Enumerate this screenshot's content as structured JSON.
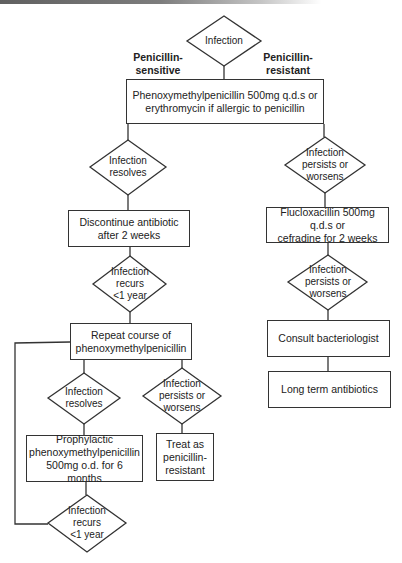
{
  "diagram": {
    "type": "flowchart",
    "branch_labels": {
      "left": "Penicillin-\nsensitive",
      "right": "Penicillin-\nresistant"
    },
    "nodes": {
      "start": {
        "shape": "diamond",
        "text": "Infection"
      },
      "first_line": {
        "shape": "box",
        "text": "Phenoxymethylpenicillin 500mg q.d.s or\nerythromycin if allergic to penicillin"
      },
      "resolves_1": {
        "shape": "diamond",
        "text": "Infection\nresolves"
      },
      "persists_1": {
        "shape": "diamond",
        "text": "Infection\npersists or\nworsens"
      },
      "discontinue": {
        "shape": "box",
        "text": "Discontinue antibiotic\nafter 2 weeks"
      },
      "recurs_1": {
        "shape": "diamond",
        "text": "Infection\nrecurs\n<1 year"
      },
      "fluclox": {
        "shape": "box",
        "text": "Flucloxacillin 500mg q.d.s or\ncefradine for 2 weeks"
      },
      "persists_2": {
        "shape": "diamond",
        "text": "Infection\npersists or\nworsens"
      },
      "consult": {
        "shape": "box",
        "text": "Consult bacteriologist"
      },
      "long_term": {
        "shape": "box",
        "text": "Long term antibiotics"
      },
      "repeat": {
        "shape": "box",
        "text": "Repeat course of\nphenoxymethylpenicillin"
      },
      "resolves_2": {
        "shape": "diamond",
        "text": "Infection\nresolves"
      },
      "persists_3": {
        "shape": "diamond",
        "text": "Infection\npersists or\nworsens"
      },
      "prophylactic": {
        "shape": "box",
        "text": "Prophylactic\nphenoxymethylpenicillin\n500mg o.d. for 6 months"
      },
      "treat_resistant": {
        "shape": "box",
        "text": "Treat as\npenicillin-\nresistant"
      },
      "recurs_2": {
        "shape": "diamond",
        "text": "Infection\nrecurs\n<1 year"
      }
    },
    "edges": [
      [
        "start",
        "first_line"
      ],
      [
        "first_line",
        "resolves_1"
      ],
      [
        "first_line",
        "persists_1"
      ],
      [
        "resolves_1",
        "discontinue"
      ],
      [
        "discontinue",
        "recurs_1"
      ],
      [
        "recurs_1",
        "repeat"
      ],
      [
        "persists_1",
        "fluclox"
      ],
      [
        "fluclox",
        "persists_2"
      ],
      [
        "persists_2",
        "consult"
      ],
      [
        "consult",
        "long_term"
      ],
      [
        "repeat",
        "resolves_2"
      ],
      [
        "repeat",
        "persists_3"
      ],
      [
        "resolves_2",
        "prophylactic"
      ],
      [
        "persists_3",
        "treat_resistant"
      ],
      [
        "prophylactic",
        "recurs_2"
      ],
      [
        "recurs_2",
        "repeat"
      ]
    ]
  }
}
